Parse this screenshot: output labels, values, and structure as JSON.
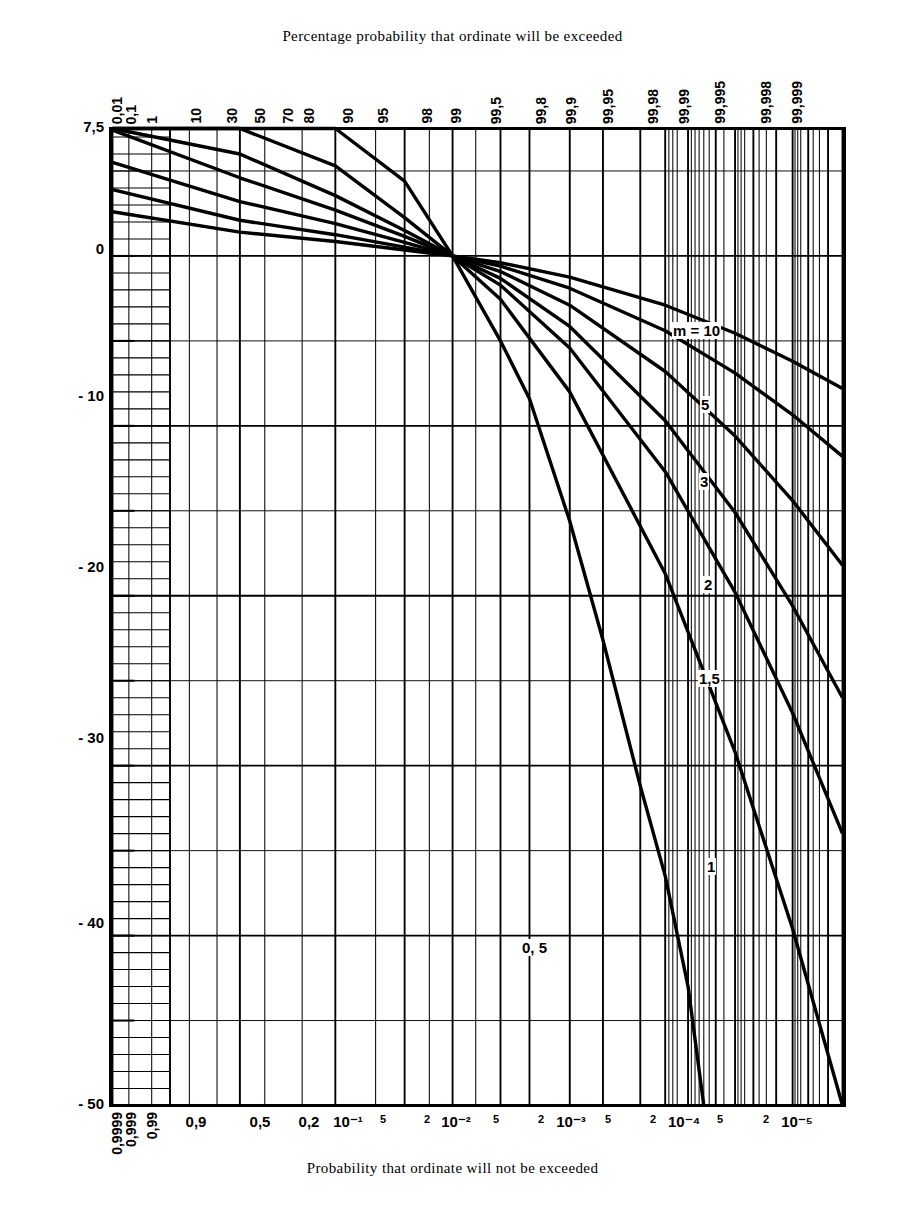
{
  "titles": {
    "top": "Percentage probability that ordinate will be exceeded",
    "bottom": "Probability that ordinate will not be exceeded",
    "yaxis": "Amplitude (dB)"
  },
  "chart_data": {
    "type": "line",
    "title": "Percentage probability that ordinate will be exceeded",
    "xlabel": "Probability that ordinate will not be exceeded",
    "ylabel": "Amplitude (dB)",
    "grid": true,
    "legend": "inline-curve-labels",
    "ylim": [
      -50,
      7.5
    ],
    "yticks": [
      7.5,
      0,
      -10,
      -20,
      -30,
      -40,
      -50
    ],
    "ytick_labels": [
      "7,5",
      "0",
      "- 10",
      "- 20",
      "- 30",
      "- 40",
      "- 50"
    ],
    "x_scale": "normal-probability (gaussian quantile)",
    "x_top_axis_label": "Percentage probability that ordinate will be exceeded",
    "x_top_ticks_percent": [
      0.01,
      0.1,
      1,
      10,
      30,
      50,
      70,
      80,
      90,
      95,
      98,
      99,
      99.5,
      99.8,
      99.9,
      99.95,
      99.98,
      99.99,
      99.995,
      99.998,
      99.999
    ],
    "x_top_tick_labels": [
      "0,01",
      "0,1",
      "1",
      "10",
      "30",
      "50",
      "70",
      "80",
      "90",
      "95",
      "98",
      "99",
      "99,5",
      "99,8",
      "99,9",
      "99,95",
      "99,98",
      "99,99",
      "99,995",
      "99,998",
      "99,999"
    ],
    "x_bottom_tick_labels": [
      "0,9999",
      "0,999",
      "0,99",
      "0,9",
      "0,5",
      "0,2",
      "10⁻¹",
      "5",
      "2",
      "10⁻²",
      "5",
      "2",
      "10⁻³",
      "5",
      "2",
      "10⁻⁴",
      "5",
      "2",
      "10⁻⁵"
    ],
    "x_bottom_tick_values": [
      0.9999,
      0.999,
      0.99,
      0.9,
      0.5,
      0.2,
      0.1,
      0.05,
      0.02,
      0.01,
      0.005,
      0.002,
      0.001,
      0.0005,
      0.0002,
      0.0001,
      5e-05,
      2e-05,
      1e-05
    ],
    "series": [
      {
        "name": "m = 10",
        "label": "m = 10",
        "x_percent": [
          0.01,
          1,
          10,
          30,
          50,
          70,
          90,
          99,
          99.9,
          99.99,
          99.999
        ],
        "values": [
          2.6,
          1.4,
          0.85,
          0.35,
          0.0,
          -0.4,
          -1.25,
          -2.9,
          -4.55,
          -6.2,
          -7.8
        ]
      },
      {
        "name": "m = 5",
        "label": "5",
        "x_percent": [
          0.01,
          1,
          10,
          30,
          50,
          70,
          90,
          99,
          99.9,
          99.99,
          99.999
        ],
        "values": [
          3.9,
          2.1,
          1.25,
          0.52,
          0.0,
          -0.6,
          -1.9,
          -4.4,
          -6.9,
          -9.35,
          -11.8
        ]
      },
      {
        "name": "m = 3",
        "label": "3",
        "x_percent": [
          0.01,
          1,
          10,
          30,
          50,
          70,
          90,
          99,
          99.9,
          99.99,
          99.999
        ],
        "values": [
          5.5,
          3.2,
          1.9,
          0.8,
          0.0,
          -0.92,
          -2.9,
          -6.8,
          -10.6,
          -14.4,
          -18.2
        ]
      },
      {
        "name": "m = 2",
        "label": "2",
        "x_percent": [
          0.01,
          1,
          10,
          30,
          50,
          70,
          90,
          99,
          99.9,
          99.99,
          99.999
        ],
        "values": [
          7.4,
          4.6,
          2.7,
          1.15,
          0.0,
          -1.32,
          -4.15,
          -9.7,
          -15.1,
          -20.6,
          -26.0
        ]
      },
      {
        "name": "m = 1.5",
        "label": "1,5",
        "x_percent": [
          0.01,
          1,
          10,
          30,
          50,
          70,
          90,
          99,
          99.9,
          99.99,
          99.999
        ],
        "values": [
          7.5,
          6.0,
          3.55,
          1.5,
          0.0,
          -1.72,
          -5.42,
          -12.7,
          -19.8,
          -26.9,
          -34.0
        ]
      },
      {
        "name": "m = 1",
        "label": "1",
        "x_percent": [
          0.01,
          1,
          10,
          30,
          50,
          70,
          90,
          99,
          99.9,
          99.99,
          99.999
        ],
        "values": [
          7.5,
          7.5,
          5.3,
          2.25,
          0.0,
          -2.55,
          -8.0,
          -18.7,
          -29.2,
          -39.6,
          -50.0
        ]
      },
      {
        "name": "m = 0.5",
        "label": "0, 5",
        "x_percent": [
          0.01,
          1,
          10,
          30,
          50,
          70,
          80,
          90,
          95,
          98,
          99,
          99.5,
          99.7
        ],
        "values": [
          7.5,
          7.5,
          7.5,
          4.4,
          0.0,
          -5.0,
          -8.4,
          -15.6,
          -22.6,
          -31.2,
          -36.5,
          -43.0,
          -50.0
        ]
      }
    ]
  },
  "axes": {
    "top_ticks": [
      {
        "label": "0,01",
        "x": 117
      },
      {
        "label": "0,1",
        "x": 131
      },
      {
        "label": "1",
        "x": 152
      },
      {
        "label": "10",
        "x": 196
      },
      {
        "label": "30",
        "x": 232
      },
      {
        "label": "50",
        "x": 260
      },
      {
        "label": "70",
        "x": 288
      },
      {
        "label": "80",
        "x": 309
      },
      {
        "label": "90",
        "x": 348
      },
      {
        "label": "95",
        "x": 383
      },
      {
        "label": "98",
        "x": 427
      },
      {
        "label": "99",
        "x": 456
      },
      {
        "label": "99,5",
        "x": 496
      },
      {
        "label": "99,8",
        "x": 541
      },
      {
        "label": "99,9",
        "x": 571
      },
      {
        "label": "99,95",
        "x": 608
      },
      {
        "label": "99,98",
        "x": 653
      },
      {
        "label": "99,99",
        "x": 684
      },
      {
        "label": "99,995",
        "x": 720
      },
      {
        "label": "99,998",
        "x": 766
      },
      {
        "label": "99,999",
        "x": 797
      }
    ],
    "bottom_ticks": [
      {
        "label": "0,9999",
        "x": 117,
        "rot": true
      },
      {
        "label": "0,999",
        "x": 131,
        "rot": true
      },
      {
        "label": "0,99",
        "x": 152,
        "rot": true
      },
      {
        "label": "0,9",
        "x": 196,
        "rot": false
      },
      {
        "label": "0,5",
        "x": 260,
        "rot": false
      },
      {
        "label": "0,2",
        "x": 309,
        "rot": false
      },
      {
        "label": "10⁻¹",
        "x": 348,
        "rot": false
      },
      {
        "label": "5",
        "x": 383,
        "rot": false,
        "small": true
      },
      {
        "label": "2",
        "x": 427,
        "rot": false,
        "small": true
      },
      {
        "label": "10⁻²",
        "x": 456,
        "rot": false
      },
      {
        "label": "5",
        "x": 496,
        "rot": false,
        "small": true
      },
      {
        "label": "2",
        "x": 541,
        "rot": false,
        "small": true
      },
      {
        "label": "10⁻³",
        "x": 571,
        "rot": false
      },
      {
        "label": "5",
        "x": 608,
        "rot": false,
        "small": true
      },
      {
        "label": "2",
        "x": 653,
        "rot": false,
        "small": true
      },
      {
        "label": "10⁻⁴",
        "x": 684,
        "rot": false
      },
      {
        "label": "5",
        "x": 720,
        "rot": false,
        "small": true
      },
      {
        "label": "2",
        "x": 766,
        "rot": false,
        "small": true
      },
      {
        "label": "10⁻⁵",
        "x": 797,
        "rot": false
      }
    ],
    "y_ticks": [
      {
        "label": "7,5",
        "y": 128
      },
      {
        "label": "0",
        "y": 250
      },
      {
        "label": "- 10",
        "y": 397
      },
      {
        "label": "- 20",
        "y": 568
      },
      {
        "label": "- 30",
        "y": 739
      },
      {
        "label": "- 40",
        "y": 924
      },
      {
        "label": "- 50",
        "y": 1105
      }
    ]
  },
  "curve_labels": [
    {
      "text": "m = 10",
      "x": 672,
      "y": 332
    },
    {
      "text": "5",
      "x": 700,
      "y": 406
    },
    {
      "text": "3",
      "x": 699,
      "y": 483
    },
    {
      "text": "2",
      "x": 703,
      "y": 586
    },
    {
      "text": "1,5",
      "x": 698,
      "y": 680
    },
    {
      "text": "1",
      "x": 706,
      "y": 868
    },
    {
      "text": "0, 5",
      "x": 521,
      "y": 949
    }
  ],
  "colors": {
    "ink": "#000000",
    "background": "#ffffff",
    "grid_minor": "#1a1a1a",
    "grid_major": "#000000"
  }
}
